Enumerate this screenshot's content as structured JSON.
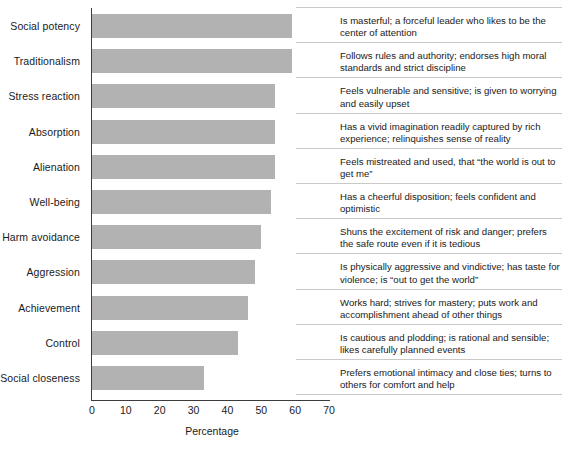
{
  "chart_data": {
    "type": "bar",
    "orientation": "horizontal",
    "title": "",
    "xlabel": "Percentage",
    "ylabel": "",
    "xlim": [
      0,
      70
    ],
    "xticks": [
      0,
      10,
      20,
      30,
      40,
      50,
      60,
      70
    ],
    "grid": false,
    "legend": null,
    "bar_color": "#b2b2b2",
    "axis_color": "#3c3c3c",
    "categories": [
      "Social potency",
      "Traditionalism",
      "Stress reaction",
      "Absorption",
      "Alienation",
      "Well-being",
      "Harm avoidance",
      "Aggression",
      "Achievement",
      "Control",
      "Social closeness"
    ],
    "values": [
      59,
      59,
      54,
      54,
      54,
      53,
      50,
      48,
      46,
      43,
      33
    ],
    "annotations": [
      "Is masterful; a forceful leader who likes to be the center of attention",
      "Follows rules and authority; endorses high moral standards and strict discipline",
      "Feels vulnerable and sensitive; is given to worrying and easily upset",
      "Has a vivid imagination readily captured by rich experience; relinquishes sense of reality",
      "Feels mistreated and used, that “the world is out to get me”",
      "Has a cheerful disposition; feels confident and optimistic",
      "Shuns the excitement of risk and danger; prefers the safe route even if it is tedious",
      "Is physically aggressive and vindictive; has taste for violence; is “out to get the world”",
      "Works hard; strives for mastery; puts work and accomplishment ahead of other things",
      "Is cautious and plodding; is rational and sensible; likes carefully planned events",
      "Prefers emotional intimacy and close ties; turns to others for comfort and help"
    ]
  }
}
